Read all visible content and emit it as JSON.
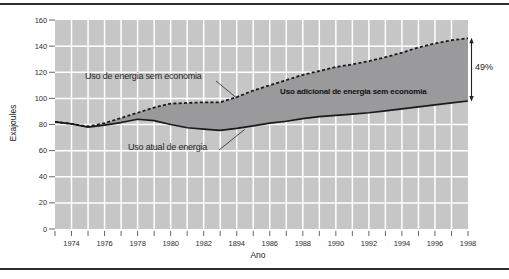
{
  "chart_data": {
    "type": "area",
    "title": "",
    "xlabel": "Ano",
    "ylabel": "Exajoules",
    "x": [
      1973,
      1974,
      1975,
      1976,
      1977,
      1978,
      1979,
      1980,
      1981,
      1982,
      1983,
      1984,
      1985,
      1986,
      1987,
      1988,
      1989,
      1990,
      1991,
      1992,
      1993,
      1994,
      1995,
      1996,
      1997,
      1998
    ],
    "x_tick_labels": [
      "1974",
      "1976",
      "1978",
      "1980",
      "1982",
      "1894",
      "1986",
      "1988",
      "1990",
      "1992",
      "1994",
      "1996",
      "1998"
    ],
    "ylim": [
      0,
      160
    ],
    "yticks": [
      0,
      20,
      40,
      60,
      80,
      100,
      120,
      140,
      160
    ],
    "grid": "white gridlines on gray plot background, yearly vertical and every 20 units horizontal",
    "legend_position": "inline-labels",
    "series": [
      {
        "name": "Uso de energia sem economia",
        "style": "dashed",
        "color": "#1a1a1a",
        "values": [
          82,
          80.5,
          78.5,
          81,
          85,
          89,
          93,
          96,
          96.5,
          97,
          97,
          101,
          106,
          110,
          114,
          118,
          121,
          124,
          126,
          128.5,
          131.5,
          135,
          139,
          142,
          144.5,
          146
        ]
      },
      {
        "name": "Uso atual de energia",
        "style": "solid",
        "color": "#1a1a1a",
        "values": [
          82,
          80.5,
          78,
          79.5,
          81.5,
          84,
          83,
          80,
          77.5,
          76.5,
          75.5,
          77,
          79,
          81,
          82.5,
          84.5,
          86,
          87,
          88,
          89,
          90.5,
          92,
          93.5,
          95,
          96.5,
          98
        ]
      }
    ],
    "band_label": "Uso adicional de energia sem economia",
    "annotations": [
      {
        "text": "49%"
      }
    ],
    "colors": {
      "plot_bg": "#c6c6c6",
      "band": "#9a9a9c",
      "gridline": "#ffffff",
      "curve": "#1a1a1a",
      "text": "#222222"
    }
  }
}
